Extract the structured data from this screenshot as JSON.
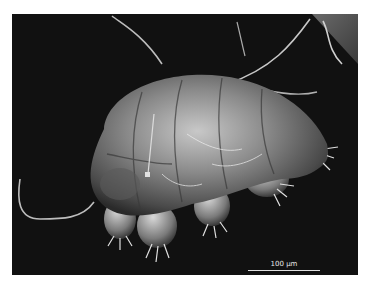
{
  "image": {
    "subject": "Scanning electron micrograph of a tardigrade (water bear)",
    "background_color": "#111111",
    "border_color": "#ffffff"
  },
  "scale_bar": {
    "label": "100 µm"
  }
}
